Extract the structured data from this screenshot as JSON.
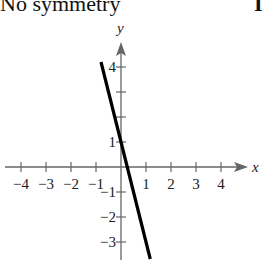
{
  "caption": {
    "left": "No symmetry",
    "right_fragment": "I"
  },
  "chart_data": {
    "type": "line",
    "title": "",
    "xlabel": "x",
    "ylabel": "y",
    "x_ticks": [
      -4,
      -3,
      -2,
      -1,
      1,
      2,
      3,
      4
    ],
    "x_tick_labels": [
      "−4",
      "−3",
      "−2",
      "−1",
      "1",
      "2",
      "3",
      "4"
    ],
    "y_ticks": [
      4,
      3,
      2,
      1,
      -1,
      -2,
      -3
    ],
    "y_tick_labels": [
      "4",
      "",
      "",
      "1",
      "−1",
      "−2",
      "−3"
    ],
    "xlim": [
      -4.5,
      5.3
    ],
    "ylim": [
      -3.7,
      5.0
    ],
    "grid": false,
    "series": [
      {
        "name": "y = -4x + 1",
        "x": [
          -0.8,
          1.17
        ],
        "y": [
          4.2,
          -3.68
        ],
        "color": "#000000"
      }
    ]
  }
}
